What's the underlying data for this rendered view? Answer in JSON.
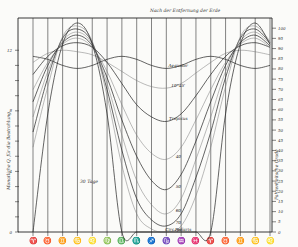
{
  "chart_data": {
    "type": "line",
    "title": "Nach der Entfernung der Erde",
    "xlabel": "",
    "ylabel_left": "Monatliche Q. für die Bestrahlung",
    "ylabel_right": "Fahrenheitsche Grade",
    "x": [
      "♈",
      "♉",
      "♊",
      "♋",
      "♌",
      "♍",
      "♎",
      "♏",
      "♐",
      "♑",
      "♒",
      "♓",
      "♈",
      "♉",
      "♊",
      "♋",
      "♌"
    ],
    "ylim": [
      0,
      13
    ],
    "yticks_left": [
      {
        "value": 0,
        "label": "0"
      },
      {
        "value": 4,
        "label": "4"
      },
      {
        "value": 8,
        "label": "8"
      },
      {
        "value": 12,
        "label": "12"
      }
    ],
    "ylim_right": [
      0,
      105
    ],
    "yticks_right": [
      "0",
      "5",
      "10",
      "15",
      "20",
      "25",
      "30",
      "35",
      "40",
      "45",
      "50",
      "55",
      "60",
      "65",
      "70",
      "75",
      "80",
      "85",
      "90",
      "95",
      "100"
    ],
    "grid": "vertical",
    "series": [
      {
        "name": "Aequator",
        "label": "Aequator",
        "values": [
          11.6,
          11.4,
          11.0,
          10.8,
          11.0,
          11.4,
          11.6,
          11.4,
          11.0,
          10.8,
          11.0,
          11.4,
          11.6,
          11.4,
          11.0,
          10.8,
          11.0
        ]
      },
      {
        "name": "10°45'",
        "label": "10°45'",
        "values": [
          11.2,
          11.8,
          12.0,
          11.9,
          11.7,
          11.2,
          10.6,
          10.0,
          9.6,
          9.5,
          9.8,
          10.5,
          11.2,
          11.8,
          12.0,
          11.9,
          11.7
        ]
      },
      {
        "name": "Tropicus",
        "label": "Tropicus",
        "values": [
          10.4,
          11.6,
          12.3,
          12.5,
          12.2,
          11.2,
          9.8,
          8.4,
          7.6,
          7.3,
          7.8,
          9.0,
          10.4,
          11.6,
          12.3,
          12.5,
          12.2
        ]
      },
      {
        "name": "40",
        "label": "40",
        "values": [
          9.4,
          11.2,
          12.4,
          12.8,
          12.2,
          10.6,
          8.4,
          6.4,
          5.2,
          4.8,
          5.6,
          7.4,
          9.4,
          11.2,
          12.4,
          12.8,
          12.2
        ]
      },
      {
        "name": "50",
        "label": "50",
        "values": [
          8.6,
          11.0,
          12.5,
          13.0,
          12.3,
          10.2,
          7.4,
          5.0,
          3.4,
          2.8,
          3.8,
          6.0,
          8.6,
          11.0,
          12.5,
          13.0,
          12.3
        ]
      },
      {
        "name": "60",
        "label": "60",
        "values": [
          7.6,
          10.6,
          12.6,
          13.2,
          12.4,
          9.8,
          6.4,
          3.4,
          1.8,
          1.2,
          2.2,
          4.8,
          7.6,
          10.6,
          12.6,
          13.2,
          12.4
        ]
      },
      {
        "name": "70",
        "label": "70",
        "values": [
          6.6,
          10.2,
          12.8,
          13.4,
          12.5,
          9.4,
          5.4,
          2.2,
          0.8,
          0.4,
          1.2,
          3.6,
          6.6,
          10.2,
          12.8,
          13.4,
          12.5
        ]
      },
      {
        "name": "Circ. polaris",
        "label": "Circ. polaris",
        "values": [
          5.6,
          9.6,
          12.9,
          13.6,
          12.6,
          9.0,
          4.4,
          1.2,
          0.2,
          0.0,
          0.4,
          2.4,
          5.6,
          9.6,
          12.9,
          13.6,
          12.6
        ]
      },
      {
        "name": "Pol",
        "label": "Pol",
        "values": [
          0.0,
          7.8,
          12.4,
          13.8,
          12.4,
          7.8,
          0.0,
          0.0,
          0.0,
          0.0,
          0.0,
          0.0,
          0.0,
          7.8,
          12.4,
          13.8,
          12.4
        ]
      }
    ],
    "annotations": [
      "30 Tage"
    ]
  }
}
